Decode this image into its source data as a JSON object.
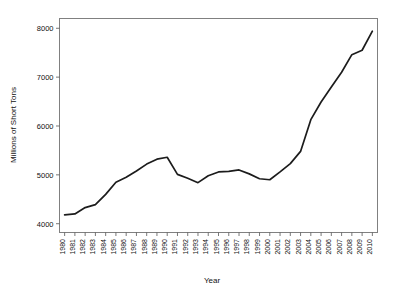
{
  "chart_data": {
    "type": "line",
    "title": "",
    "xlabel": "Year",
    "ylabel": "Millions of Short Tons",
    "xlim": [
      1979.5,
      2010.5
    ],
    "ylim": [
      3820,
      8200
    ],
    "grid": false,
    "legend": null,
    "y_ticks": [
      4000,
      5000,
      6000,
      7000,
      8000
    ],
    "y_tick_labels": [
      "4000",
      "5000",
      "6000",
      "7000",
      "8000"
    ],
    "x_ticks": [
      1980,
      1981,
      1982,
      1983,
      1984,
      1985,
      1986,
      1987,
      1988,
      1989,
      1990,
      1991,
      1992,
      1993,
      1994,
      1995,
      1996,
      1997,
      1998,
      1999,
      2000,
      2001,
      2002,
      2003,
      2004,
      2005,
      2006,
      2007,
      2008,
      2009,
      2010
    ],
    "x_tick_labels": [
      "1980",
      "1981",
      "1982",
      "1983",
      "1984",
      "1985",
      "1986",
      "1987",
      "1988",
      "1989",
      "1990",
      "1991",
      "1992",
      "1993",
      "1994",
      "1995",
      "1996",
      "1997",
      "1998",
      "1999",
      "2000",
      "2001",
      "2002",
      "2003",
      "2004",
      "2005",
      "2006",
      "2007",
      "2008",
      "2009",
      "2010"
    ],
    "x": [
      1980,
      1981,
      1982,
      1983,
      1984,
      1985,
      1986,
      1987,
      1988,
      1989,
      1990,
      1991,
      1992,
      1993,
      1994,
      1995,
      1996,
      1997,
      1998,
      1999,
      2000,
      2001,
      2002,
      2003,
      2004,
      2005,
      2006,
      2007,
      2008,
      2009,
      2010
    ],
    "values": [
      4180,
      4200,
      4330,
      4390,
      4600,
      4850,
      4950,
      5080,
      5220,
      5320,
      5360,
      5010,
      4930,
      4840,
      4980,
      5060,
      5070,
      5100,
      5020,
      4920,
      4900,
      5060,
      5230,
      5480,
      6130,
      6490,
      6800,
      7100,
      7460,
      7550,
      7940
    ],
    "series": [
      {
        "name": "World Coal Production",
        "color": "#1c1c1c",
        "values": [
          4180,
          4200,
          4330,
          4390,
          4600,
          4850,
          4950,
          5080,
          5220,
          5320,
          5360,
          5010,
          4930,
          4840,
          4980,
          5060,
          5070,
          5100,
          5020,
          4920,
          4900,
          5060,
          5230,
          5480,
          6130,
          6490,
          6800,
          7100,
          7460,
          7550,
          7940
        ]
      }
    ]
  },
  "axes": {
    "x_label": "Year",
    "y_label": "Millions of Short Tons"
  },
  "colors": {
    "line": "#1c1c1c",
    "frame": "#808080",
    "background": "#ffffff",
    "text": "#111111"
  }
}
